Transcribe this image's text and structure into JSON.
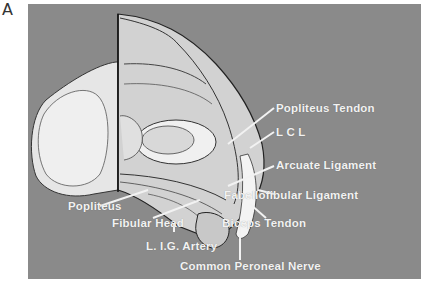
{
  "panel_letter": "A",
  "figure": {
    "background_color": "#8a8a8a",
    "labels": {
      "popliteus_tendon": "Popliteus Tendon",
      "lcl": "L C L",
      "arcuate_ligament": "Arcuate Ligament",
      "fabellofibular_ligament": "Fabellofibular Ligament",
      "popliteus": "Popliteus",
      "fibular_head": "Fibular Head",
      "biceps_tendon": "Biceps Tendon",
      "lig_artery": "L. I.G. Artery",
      "common_peroneal_nerve": "Common Peroneal Nerve"
    }
  }
}
